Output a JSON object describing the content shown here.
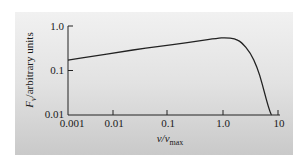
{
  "chart_data": {
    "type": "line",
    "title": "",
    "xlabel": "ν/ν_max",
    "ylabel": "F_ν/arbitrary units",
    "xscale": "log",
    "yscale": "log",
    "xlim": [
      0.001,
      10
    ],
    "ylim": [
      0.01,
      1.0
    ],
    "x_ticks": [
      "0.001",
      "0.01",
      "0.1",
      "1.0",
      "10"
    ],
    "y_ticks": [
      "0.01",
      "0.1",
      "1.0"
    ],
    "grid": false,
    "legend": null,
    "series": [
      {
        "name": "synchrotron spectrum",
        "x": [
          0.001,
          0.003,
          0.01,
          0.03,
          0.1,
          0.3,
          0.7,
          1.0,
          1.5,
          2.0,
          3.0,
          4.0,
          5.0,
          6.0,
          7.0,
          7.5
        ],
        "y": [
          0.17,
          0.21,
          0.26,
          0.32,
          0.38,
          0.46,
          0.53,
          0.55,
          0.52,
          0.44,
          0.25,
          0.12,
          0.05,
          0.022,
          0.012,
          0.01
        ]
      }
    ]
  },
  "labels": {
    "y_title_main": "F",
    "y_title_sub": "ν",
    "y_title_rest": "/arbitrary units",
    "x_title_main": "ν/ν",
    "x_title_sub": "max",
    "x_ticks": [
      "0.001",
      "0.01",
      "0.1",
      "1.0",
      "10"
    ],
    "y_ticks": [
      "1.0",
      "0.1",
      "0.01"
    ]
  }
}
